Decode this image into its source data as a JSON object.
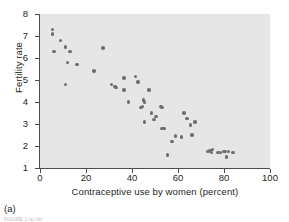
{
  "figure": {
    "panel_caption": "(a)",
    "trailing_caption": "FIGURE 1  (a) (b)"
  },
  "chart_data": {
    "type": "scatter",
    "title": "",
    "xlabel": "Contraceptive use by women (percent)",
    "ylabel": "Fertility rate",
    "xlim": [
      0,
      100
    ],
    "ylim": [
      1,
      8
    ],
    "xticks": [
      0,
      20,
      40,
      60,
      80,
      100
    ],
    "yticks": [
      1,
      2,
      3,
      4,
      5,
      6,
      7,
      8
    ],
    "xtick_labels": [
      "0",
      "20",
      "40",
      "60",
      "80",
      "100"
    ],
    "ytick_labels": [
      "1",
      "2",
      "3",
      "4",
      "5",
      "6",
      "7",
      "8"
    ],
    "grid": false,
    "legend": "none",
    "marker_color": "#6e6e6e",
    "plot_background": "#e6e6e6",
    "axis_color": "#4d4d4d",
    "points": [
      [
        5.5,
        7.3
      ],
      [
        5.5,
        7.1
      ],
      [
        6.0,
        6.3
      ],
      [
        9.0,
        6.8
      ],
      [
        11.0,
        6.5
      ],
      [
        11.0,
        4.8
      ],
      [
        12.0,
        5.8
      ],
      [
        13.0,
        6.3
      ],
      [
        16.0,
        5.7
      ],
      [
        23.5,
        5.4
      ],
      [
        27.5,
        6.45
      ],
      [
        31.0,
        4.8
      ],
      [
        32.5,
        4.7
      ],
      [
        33.0,
        4.65
      ],
      [
        36.5,
        5.1
      ],
      [
        36.5,
        4.55
      ],
      [
        38.5,
        4.0
      ],
      [
        41.5,
        5.15
      ],
      [
        42.5,
        4.9
      ],
      [
        44.0,
        3.75
      ],
      [
        44.5,
        3.8
      ],
      [
        45.0,
        4.1
      ],
      [
        45.5,
        4.0
      ],
      [
        45.5,
        3.1
      ],
      [
        47.5,
        4.55
      ],
      [
        48.5,
        3.5
      ],
      [
        49.5,
        3.2
      ],
      [
        50.5,
        3.35
      ],
      [
        52.5,
        3.8
      ],
      [
        53.0,
        3.75
      ],
      [
        53.0,
        2.8
      ],
      [
        54.0,
        2.8
      ],
      [
        55.5,
        1.6
      ],
      [
        57.5,
        2.2
      ],
      [
        59.0,
        2.45
      ],
      [
        61.5,
        2.4
      ],
      [
        62.5,
        3.5
      ],
      [
        64.0,
        3.25
      ],
      [
        65.5,
        2.95
      ],
      [
        66.0,
        2.5
      ],
      [
        67.5,
        3.1
      ],
      [
        73.0,
        1.75
      ],
      [
        74.0,
        1.8
      ],
      [
        74.5,
        1.7
      ],
      [
        75.0,
        1.85
      ],
      [
        77.5,
        1.7
      ],
      [
        78.5,
        1.7
      ],
      [
        80.0,
        1.75
      ],
      [
        80.5,
        1.75
      ],
      [
        81.0,
        1.5
      ],
      [
        82.0,
        1.75
      ],
      [
        84.0,
        1.7
      ]
    ]
  }
}
